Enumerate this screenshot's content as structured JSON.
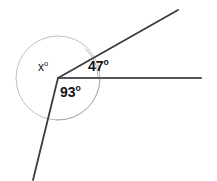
{
  "figure": {
    "kind": "angle-diagram",
    "background_color": "#ffffff",
    "vertex": {
      "x": 58,
      "y": 78
    },
    "colors": {
      "ray_stroke": "#3b3b44",
      "arc_stroke": "#a9a9ae",
      "circle_stroke": "#b9b9bd",
      "text": "#141418"
    },
    "circle": {
      "center_x": 58,
      "center_y": 78,
      "radius": 42
    },
    "rays": [
      {
        "name": "horizontal-right-ray",
        "from_x": 58,
        "from_y": 78,
        "to_x": 201,
        "to_y": 78,
        "angle_deg": 0
      },
      {
        "name": "upper-right-ray",
        "from_x": 58,
        "from_y": 78,
        "to_x": 178,
        "to_y": 10,
        "angle_deg": 47
      },
      {
        "name": "lower-left-ray",
        "from_x": 58,
        "from_y": 78,
        "to_x": 33,
        "to_y": 180,
        "angle_deg": 256
      }
    ],
    "arcs": [
      {
        "name": "arc-47",
        "radius": 40,
        "start_deg": 0,
        "end_deg": 47
      },
      {
        "name": "arc-93",
        "radius": 42,
        "start_deg": 267,
        "end_deg": 360
      }
    ],
    "labels": [
      {
        "name": "angle-label-x",
        "value": "x",
        "degree_mark": "o",
        "x": 38,
        "y": 60,
        "bold": false
      },
      {
        "name": "angle-label-47",
        "value": "47",
        "degree_mark": "o",
        "x": 88,
        "y": 58,
        "bold": true
      },
      {
        "name": "angle-label-93",
        "value": "93",
        "degree_mark": "o",
        "x": 60,
        "y": 84,
        "bold": true
      }
    ]
  },
  "chart_data": {
    "type": "diagram",
    "title": "",
    "angles": [
      {
        "label": "x",
        "value": null,
        "unit": "degrees",
        "known": false
      },
      {
        "label": "47",
        "value": 47,
        "unit": "degrees",
        "known": true
      },
      {
        "label": "93",
        "value": 93,
        "unit": "degrees",
        "known": true
      }
    ],
    "total_around_point": 360
  }
}
